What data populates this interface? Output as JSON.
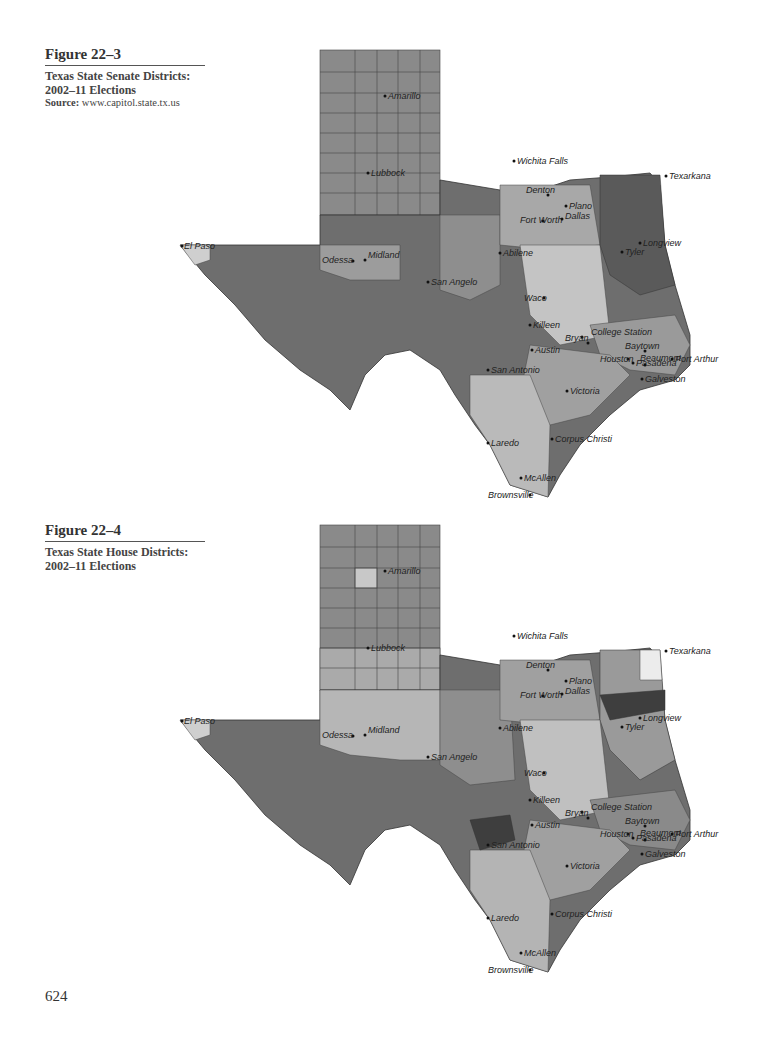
{
  "page": {
    "page_number": "624"
  },
  "figures": [
    {
      "number": "Figure 22–3",
      "title_line1": "Texas State Senate Districts:",
      "title_line2": "2002–11 Elections",
      "source_label": "Source:",
      "source_value": "www.capitol.state.tx.us"
    },
    {
      "number": "Figure 22–4",
      "title_line1": "Texas State House Districts:",
      "title_line2": "2002–11 Elections"
    }
  ],
  "map_labels": {
    "cities": [
      "El Paso",
      "Odessa",
      "Midland",
      "San Angelo",
      "Abilene",
      "Lubbock",
      "Amarillo",
      "Wichita Falls",
      "Denton",
      "Plano",
      "Fort Worth",
      "Dallas",
      "Texarkana",
      "Longview",
      "Tyler",
      "Waco",
      "Killeen",
      "Bryan",
      "College Station",
      "Austin",
      "San Antonio",
      "Houston",
      "Pasadena",
      "Baytown",
      "Beaumont",
      "Port Arthur",
      "Galveston",
      "Victoria",
      "Corpus Christi",
      "Laredo",
      "McAllen",
      "Brownsville"
    ],
    "panhandle_rows": [
      [
        "DALLAM",
        "SHERMAN",
        "HANSFORD",
        "OCHILTREE",
        "LIPSCOMB"
      ],
      [
        "HARTLEY",
        "MOORE",
        "HUTCHINSON",
        "ROBERTS",
        "HEMPHILL"
      ],
      [
        "OLDHAM",
        "POTTER",
        "CARSON",
        "GRAY",
        "WHEELER"
      ],
      [
        "DEAF SMITH",
        "RANDALL",
        "ARMSTRONG",
        "DONLEY",
        "COLLINGSWORTH"
      ],
      [
        "PARMER",
        "CASTRO",
        "SWISHER",
        "BRISCOE",
        "HALL",
        "CHILDRESS"
      ],
      [
        "BAILEY",
        "LAMB",
        "HALE",
        "FLOYD",
        "MOTLEY",
        "COTTLE"
      ],
      [
        "COCHRAN",
        "HOCKLEY",
        "LUBBOCK",
        "CROSBY",
        "DICKENS",
        "KING"
      ],
      [
        "YOAKUM",
        "TERRY",
        "LYNN",
        "GARZA",
        "KENT",
        "STONEWALL"
      ],
      [
        "GAINES",
        "DAWSON",
        "BORDEN",
        "SCURRY",
        "FISHER",
        "JONES"
      ],
      [
        "ANDREWS",
        "MARTIN",
        "HOWARD",
        "MITCHELL",
        "NOLAN",
        "TAYLOR"
      ]
    ],
    "west_counties": [
      "HUDSPETH",
      "CULBERSON",
      "REEVES",
      "JEFF DAVIS",
      "PRESIDIO",
      "BREWSTER",
      "PECOS",
      "TERRELL",
      "VAL VERDE",
      "CROCKETT",
      "SUTTON",
      "EDWARDS",
      "KINNEY",
      "MAVERICK",
      "LOVING",
      "WINKLER",
      "ECTOR",
      "WARD",
      "CRANE",
      "UPTON",
      "REAGAN",
      "IRION",
      "TOM GREEN"
    ],
    "south_counties": [
      "ZAVALA",
      "FRIO",
      "DIMMIT",
      "LA SALLE",
      "WEBB",
      "DUVAL",
      "ZAPATA",
      "JIM HOGG",
      "BROOKS",
      "KENEDY",
      "STARR",
      "HIDALGO",
      "WILLACY",
      "CAMERON",
      "NUECES",
      "KLEBERG",
      "LIVE OAK",
      "McMULLEN",
      "JIM WELLS",
      "SAN PATRICIO"
    ],
    "east_counties": [
      "BOWIE",
      "CASS",
      "RED RIVER",
      "LAMAR",
      "FANNIN",
      "GRAYSON",
      "COOKE",
      "MONTAGUE",
      "CLAY",
      "ARCHER",
      "WICHITA",
      "SMITH",
      "GREGG",
      "HARRISON",
      "PANOLA",
      "RUSK",
      "SHELBY",
      "NACOGDOCHES",
      "ANGELINA",
      "HOUSTON",
      "POLK",
      "TYLER",
      "JASPER",
      "NEWTON",
      "HARDIN",
      "JEFFERSON",
      "ORANGE",
      "LIBERTY",
      "CHAMBERS",
      "HARRIS",
      "FORT BEND",
      "BRAZORIA",
      "GALVESTON",
      "MATAGORDA",
      "WHARTON",
      "JACKSON",
      "CALHOUN",
      "VICTORIA"
    ]
  },
  "legend_note": "Shading indicates district groupings (grayscale choropleth)",
  "colors": {
    "darkest": "#3d3d3d",
    "dark": "#6a6a6a",
    "mid": "#8e8e8e",
    "light": "#b4b4b4",
    "lightest": "#d6d6d6",
    "white": "#f4f4f4",
    "border": "#333333"
  }
}
